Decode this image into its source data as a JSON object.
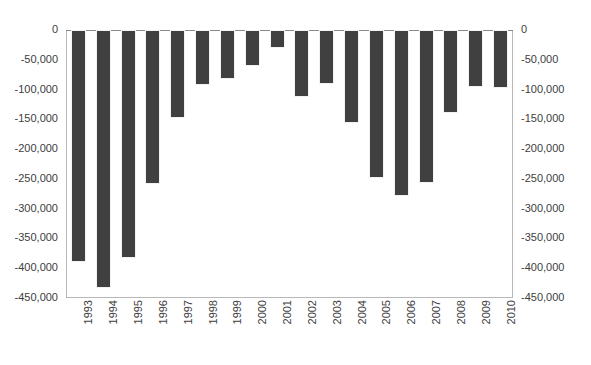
{
  "chart_data": {
    "type": "bar",
    "title": "",
    "subtitle": "",
    "xlabel": "",
    "ylabel": "",
    "ylim": [
      -450000,
      0
    ],
    "grid": false,
    "legend": null,
    "bar_color": "#404040",
    "axis_color": "#b8b8b8",
    "dual_y_axis": true,
    "categories": [
      "1993",
      "1994",
      "1995",
      "1996",
      "1997",
      "1998",
      "1999",
      "2000",
      "2001",
      "2002",
      "2003",
      "2004",
      "2005",
      "2006",
      "2007",
      "2008",
      "2009",
      "2010"
    ],
    "values": [
      -389000,
      -433000,
      -382000,
      -258000,
      -147000,
      -92000,
      -82000,
      -60000,
      -30000,
      -112000,
      -90000,
      -156000,
      -248000,
      -279000,
      -257000,
      -139000,
      -95000,
      -97000
    ],
    "yticks": [
      0,
      -50000,
      -100000,
      -150000,
      -200000,
      -250000,
      -300000,
      -350000,
      -400000,
      -450000
    ],
    "ytick_labels_left": [
      "0",
      "-50,000",
      "-100,000",
      "-150,000",
      "-200,000",
      "-250,000",
      "-300,000",
      "-350,000",
      "-400,000",
      "-450,000"
    ],
    "ytick_labels_right": [
      "0",
      "-50,000",
      "-100,000",
      "-150,000",
      "-200,000",
      "-250,000",
      "-300,000",
      "-350,000",
      "-400,000",
      "-450,000"
    ]
  },
  "footnote": ""
}
